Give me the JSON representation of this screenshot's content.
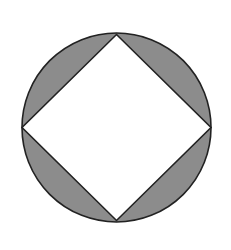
{
  "figure": {
    "canvas": {
      "width": 231,
      "height": 250
    },
    "circle": {
      "cx": 116.5,
      "cy": 127.5,
      "r": 94.5
    },
    "square_vertices": {
      "top": [
        116.5,
        34.5
      ],
      "right": [
        211,
        127.5
      ],
      "bottom": [
        116.5,
        220.5
      ],
      "left": [
        22,
        127.5
      ]
    },
    "colors": {
      "background": "#ffffff",
      "segment_fill": "#8c8c8c",
      "square_fill": "#ffffff",
      "stroke": "#222222"
    },
    "stroke_width": 1.6,
    "shaded_regions": [
      "top-left segment",
      "top-right segment",
      "bottom-right segment",
      "bottom-left segment"
    ]
  }
}
